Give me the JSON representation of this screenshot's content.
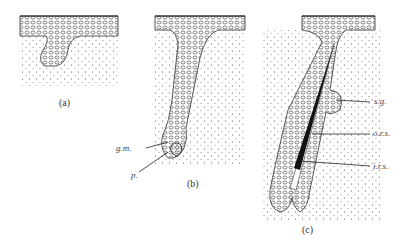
{
  "figure": {
    "panels": [
      {
        "id": "a",
        "label": "(a)"
      },
      {
        "id": "b",
        "label": "(b)"
      },
      {
        "id": "c",
        "label": "(c)"
      }
    ],
    "annotations": {
      "b": [
        {
          "key": "gm",
          "text": "g.m."
        },
        {
          "key": "p",
          "text": "p."
        }
      ],
      "c": [
        {
          "key": "sg",
          "text": "s.g."
        },
        {
          "key": "ors",
          "text": "o.r.s."
        },
        {
          "key": "irs",
          "text": "i.r.s."
        }
      ]
    },
    "colors": {
      "ink": "#222222",
      "background": "#ffffff",
      "hair_shaft": "#111111"
    }
  }
}
